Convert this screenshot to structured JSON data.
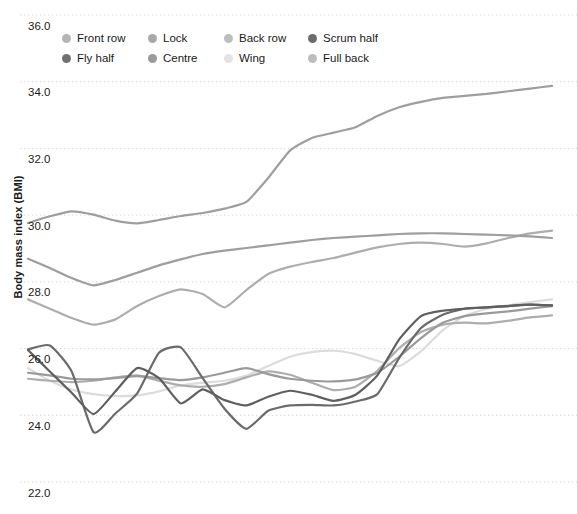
{
  "chart_data": {
    "type": "line",
    "title": "",
    "xlabel": "",
    "ylabel": "Body mass index (BMI)",
    "ylim": [
      22.0,
      36.0
    ],
    "yticks": [
      36.0,
      34.0,
      32.0,
      30.0,
      28.0,
      26.0,
      24.0,
      22.0
    ],
    "ytick_labels": [
      "36.0",
      "34.0",
      "32.0",
      "30.0",
      "28.0",
      "26.0",
      "24.0",
      "22.0"
    ],
    "xlim": [
      0,
      24
    ],
    "xticks": [],
    "xtick_labels": [],
    "grid": true,
    "grid_style": "dotted",
    "legend_position": "top-left",
    "x": [
      0,
      1,
      2,
      3,
      4,
      5,
      6,
      7,
      8,
      9,
      10,
      11,
      12,
      13,
      14,
      15,
      16,
      17,
      18,
      19,
      20,
      21,
      22,
      23,
      24
    ],
    "series": [
      {
        "name": "Front row",
        "color": "#9e9e9e",
        "values": [
          29.75,
          29.95,
          30.1,
          30.0,
          29.82,
          29.74,
          29.84,
          29.96,
          30.05,
          30.18,
          30.38,
          31.1,
          31.92,
          32.3,
          32.46,
          32.62,
          32.96,
          33.22,
          33.38,
          33.5,
          33.56,
          33.62,
          33.7,
          33.78,
          33.86
        ]
      },
      {
        "name": "Lock",
        "color": "#9e9e9e",
        "values": [
          28.68,
          28.4,
          28.1,
          27.88,
          28.04,
          28.26,
          28.48,
          28.66,
          28.82,
          28.92,
          29.0,
          29.08,
          29.16,
          29.24,
          29.3,
          29.34,
          29.38,
          29.42,
          29.44,
          29.44,
          29.42,
          29.4,
          29.38,
          29.35,
          29.3
        ]
      },
      {
        "name": "Back row",
        "color": "#adadad",
        "values": [
          27.46,
          27.18,
          26.9,
          26.7,
          26.86,
          27.26,
          27.56,
          27.76,
          27.62,
          27.22,
          27.74,
          28.22,
          28.44,
          28.58,
          28.7,
          28.86,
          29.02,
          29.12,
          29.16,
          29.12,
          29.04,
          29.14,
          29.3,
          29.44,
          29.52
        ]
      },
      {
        "name": "Scrum half",
        "color": "#6b6b6b",
        "values": [
          25.96,
          26.08,
          25.3,
          23.48,
          24.04,
          24.64,
          25.86,
          26.02,
          25.1,
          24.18,
          23.58,
          24.12,
          24.28,
          24.3,
          24.28,
          24.4,
          24.62,
          25.7,
          26.6,
          27.0,
          27.18,
          27.22,
          27.26,
          27.3,
          27.28
        ]
      },
      {
        "name": "Fly half",
        "color": "#5f5f5f",
        "values": [
          25.94,
          25.3,
          24.66,
          24.02,
          24.7,
          25.4,
          25.1,
          24.34,
          24.76,
          24.44,
          24.28,
          24.54,
          24.72,
          24.6,
          24.42,
          24.6,
          25.18,
          26.26,
          26.96,
          27.12,
          27.18,
          27.22,
          27.26,
          27.3,
          27.28
        ]
      },
      {
        "name": "Centre",
        "color": "#9a9a9a",
        "values": [
          25.26,
          25.18,
          25.08,
          25.06,
          25.1,
          25.16,
          25.1,
          25.04,
          25.12,
          25.26,
          25.4,
          25.22,
          25.08,
          25.02,
          25.0,
          25.06,
          25.26,
          25.74,
          26.3,
          26.76,
          26.96,
          27.04,
          27.1,
          27.18,
          27.26
        ]
      },
      {
        "name": "Wing",
        "color": "#dcdcdc",
        "values": [
          25.4,
          25.02,
          24.76,
          24.62,
          24.56,
          24.58,
          24.7,
          24.88,
          24.96,
          25.02,
          25.18,
          25.46,
          25.74,
          25.88,
          25.92,
          25.82,
          25.62,
          25.46,
          25.9,
          26.54,
          26.96,
          27.18,
          27.28,
          27.38,
          27.46
        ]
      },
      {
        "name": "Full back",
        "color": "#adadad",
        "values": [
          25.08,
          25.02,
          24.98,
          25.02,
          25.12,
          25.18,
          25.02,
          24.88,
          24.84,
          24.92,
          25.12,
          25.3,
          25.2,
          24.96,
          24.74,
          24.84,
          25.32,
          26.0,
          26.48,
          26.7,
          26.76,
          26.74,
          26.82,
          26.92,
          26.98
        ]
      }
    ]
  },
  "legend": {
    "items": [
      {
        "label": "Front row",
        "color": "#b5b5b5"
      },
      {
        "label": "Lock",
        "color": "#a8a8a8"
      },
      {
        "label": "Back row",
        "color": "#bdbdbd"
      },
      {
        "label": "Scrum half",
        "color": "#6b6b6b"
      },
      {
        "label": "Fly half",
        "color": "#707070"
      },
      {
        "label": "Centre",
        "color": "#9a9a9a"
      },
      {
        "label": "Wing",
        "color": "#e3e3e3"
      },
      {
        "label": "Full back",
        "color": "#bdbdbd"
      }
    ]
  },
  "axis": {
    "y_title": "Body mass index (BMI)"
  },
  "style": {
    "grid_color": "#d9d9d9",
    "background": "#ffffff",
    "text_color": "#1a1a1a"
  }
}
